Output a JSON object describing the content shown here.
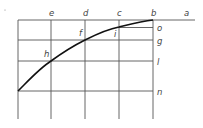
{
  "diagram": {
    "type": "geometric-construction",
    "top_labels": [
      {
        "id": "e",
        "text": "e",
        "x": 51
      },
      {
        "id": "d",
        "text": "d",
        "x": 85
      },
      {
        "id": "c",
        "text": "c",
        "x": 119
      },
      {
        "id": "b",
        "text": "b",
        "x": 153
      },
      {
        "id": "a",
        "text": "a",
        "x": 186
      }
    ],
    "right_labels": [
      {
        "id": "o",
        "text": "o",
        "y": 27
      },
      {
        "id": "g",
        "text": "g",
        "y": 40
      },
      {
        "id": "l",
        "text": "l",
        "y": 61
      },
      {
        "id": "n",
        "text": "n",
        "y": 91
      }
    ],
    "curve_labels": [
      {
        "id": "h",
        "text": "h",
        "x": 45,
        "y": 56
      },
      {
        "id": "f",
        "text": "f",
        "x": 79,
        "y": 35
      },
      {
        "id": "i",
        "text": "i",
        "x": 114,
        "y": 36
      }
    ],
    "colors": {
      "line": "#555555",
      "curve": "#111111",
      "label": "#444444",
      "background": "#ffffff"
    }
  }
}
